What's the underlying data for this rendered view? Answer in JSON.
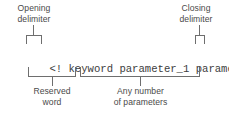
{
  "figure": {
    "type": "syntax-annotation-diagram",
    "background_color": "#ffffff",
    "line_color": "#6e6e6e",
    "label_color": "#4a4a4a",
    "code_color": "#3d3d3d"
  },
  "code": {
    "full": "<! keyword parameter_1 parameter_2 >",
    "open_delimiter": "<!",
    "keyword": "keyword",
    "parameter_1": "parameter_1",
    "parameter_2": "parameter_2",
    "close_delimiter": ">",
    "space": " "
  },
  "annotations": {
    "opening_delimiter": {
      "line1": "Opening",
      "line2": "delimiter"
    },
    "closing_delimiter": {
      "line1": "Closing",
      "line2": "delimiter"
    },
    "reserved_word": {
      "line1": "Reserved",
      "line2": "word"
    },
    "parameters": {
      "line1": "Any number",
      "line2": "of parameters"
    }
  }
}
